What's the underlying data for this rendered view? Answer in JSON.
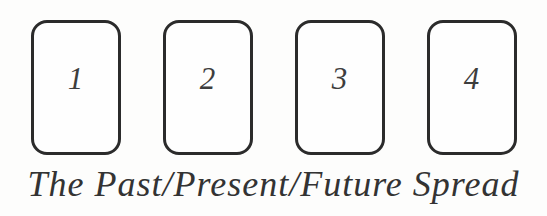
{
  "figure": {
    "caption": "The Past/Present/Future Spread",
    "cards": [
      {
        "number": "1"
      },
      {
        "number": "2"
      },
      {
        "number": "3"
      },
      {
        "number": "4"
      }
    ],
    "colors": {
      "card_border": "#2b2b2b",
      "ink": "#333333",
      "background": "#fdfdfc"
    }
  }
}
